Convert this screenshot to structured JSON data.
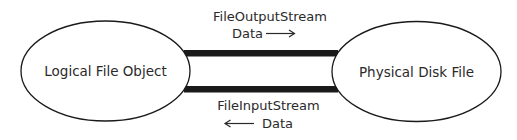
{
  "diagram": {
    "nodes": {
      "logical": {
        "label": "Logical File Object"
      },
      "physical": {
        "label": "Physical Disk File"
      }
    },
    "connections": {
      "output": {
        "stream_label": "FileOutputStream",
        "data_label": "Data",
        "arrow_direction": "right"
      },
      "input": {
        "stream_label": "FileInputStream",
        "data_label": "Data",
        "arrow_direction": "left"
      }
    },
    "colors": {
      "stroke": "#1a1a1a",
      "text": "#2a2a2a",
      "background": "#ffffff"
    }
  }
}
